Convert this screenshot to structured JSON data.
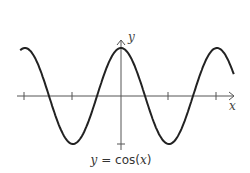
{
  "chart_data": {
    "type": "line",
    "title": "",
    "caption": "y = cos(x)",
    "xlabel": "x",
    "ylabel": "y",
    "function": "cos(x)",
    "x_range": [
      -2.1,
      2.35
    ],
    "x_units": "pi",
    "ylim": [
      -1.2,
      1.2
    ],
    "x_ticks": [
      -2,
      -1,
      1,
      2
    ],
    "y_ticks": [
      -1
    ],
    "grid": false,
    "series": [
      {
        "name": "y = cos(x)",
        "color": "#222222"
      }
    ]
  },
  "labels": {
    "x": "x",
    "y": "y",
    "caption_left": "y",
    "caption_mid": " = cos(",
    "caption_var": "x",
    "caption_right": ")"
  }
}
